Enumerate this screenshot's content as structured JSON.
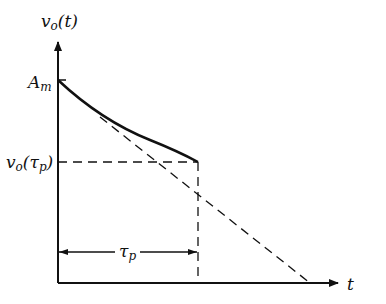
{
  "diagram": {
    "y_axis_label": {
      "main": "v",
      "sub": "o",
      "arg": "(t)"
    },
    "x_axis_label": "t",
    "amplitude_label": {
      "main": "A",
      "sub": "m"
    },
    "level_label": {
      "main": "v",
      "sub": "o",
      "arg_open": "(τ",
      "arg_sub": "p",
      "arg_close": ")"
    },
    "duration_label": {
      "main": "τ",
      "sub": "p"
    },
    "elements": [
      "decaying curve from A_m to v_o(τ_p)",
      "dashed tangent line from A_m to t-axis",
      "dashed horizontal line at v_o(τ_p)",
      "dashed vertical line at τ_p",
      "double-headed arrow spanning τ_p"
    ],
    "colors": {
      "ink": "#111111",
      "background": "#ffffff"
    }
  }
}
